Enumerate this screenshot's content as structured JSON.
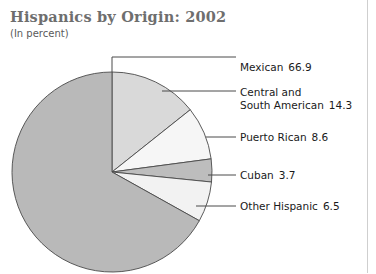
{
  "chart": {
    "title": "Hispanics by Origin: 2002",
    "subtitle": "(In percent)"
  },
  "legend": {
    "mexican": {
      "name": "Mexican",
      "value": "66.9"
    },
    "central": {
      "line1": "Central and",
      "line2": "South American",
      "value": "14.3"
    },
    "puerto_rican": {
      "name": "Puerto Rican",
      "value": "8.6"
    },
    "cuban": {
      "name": "Cuban",
      "value": "3.7"
    },
    "other": {
      "name": "Other Hispanic",
      "value": "6.5"
    }
  },
  "colors": {
    "mexican": "#b9b9b9",
    "central": "#d9d9d9",
    "puerto_rican": "#f6f6f6",
    "cuban": "#bdbdbd",
    "other": "#f2f2f2",
    "outline": "#4a4a4a",
    "leader_line": "#4a4a4a",
    "title": "#6e6e6e",
    "label_text": "#1a1a1a",
    "frame": "#cfcfcf"
  },
  "chart_data": {
    "type": "pie",
    "title": "Hispanics by Origin: 2002",
    "subtitle": "(In percent)",
    "unit": "percent",
    "start_angle_deg": 0,
    "direction": "clockwise",
    "legend_position": "right-callouts",
    "grid": false,
    "total": 100.0,
    "labels": [
      "Mexican",
      "Central and South American",
      "Puerto Rican",
      "Cuban",
      "Other Hispanic"
    ],
    "values": [
      66.9,
      14.3,
      8.6,
      3.7,
      6.5
    ],
    "slices": [
      {
        "label": "Central and South American",
        "value": 14.3,
        "color": "#d9d9d9",
        "start_deg": 0.0,
        "end_deg": 51.48
      },
      {
        "label": "Puerto Rican",
        "value": 8.6,
        "color": "#f6f6f6",
        "start_deg": 51.48,
        "end_deg": 82.44
      },
      {
        "label": "Cuban",
        "value": 3.7,
        "color": "#bdbdbd",
        "start_deg": 82.44,
        "end_deg": 95.76
      },
      {
        "label": "Other Hispanic",
        "value": 6.5,
        "color": "#f2f2f2",
        "start_deg": 95.76,
        "end_deg": 119.16
      },
      {
        "label": "Mexican",
        "value": 66.9,
        "color": "#b9b9b9",
        "start_deg": 119.16,
        "end_deg": 360.0
      }
    ],
    "geometry": {
      "center_x": 112,
      "center_y": 172,
      "radius": 100
    }
  }
}
